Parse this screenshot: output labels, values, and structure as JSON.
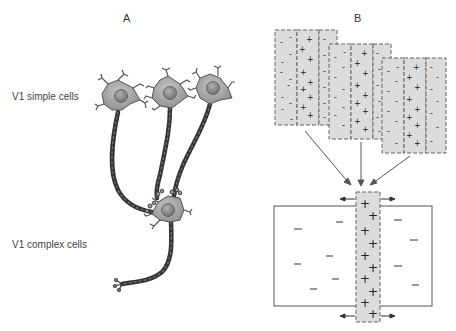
{
  "panels": {
    "a": {
      "label": "A",
      "rows": [
        {
          "label": "V1 simple cells"
        },
        {
          "label": "V1 complex cells"
        }
      ],
      "simple_cell_count": 3,
      "complex_cell_count": 1
    },
    "b": {
      "label": "B",
      "simple_receptive_fields": [
        {
          "name": "field-1",
          "subregions": [
            "-",
            "+",
            "-"
          ]
        },
        {
          "name": "field-2",
          "subregions": [
            "-",
            "+",
            "-"
          ]
        },
        {
          "name": "field-3",
          "subregions": [
            "-",
            "+",
            "-"
          ]
        }
      ],
      "complex_receptive_field": {
        "flanks": [
          "-",
          "-"
        ],
        "center": "+",
        "arrows": [
          "left",
          "right"
        ]
      }
    }
  },
  "colors": {
    "neuron_body": "#a6a6a6",
    "neuron_nucleus": "#8c8c8c",
    "axon": "#3a3a3a",
    "field_fill": "#dcdcdc",
    "dash": "#666666",
    "line": "#555555"
  }
}
